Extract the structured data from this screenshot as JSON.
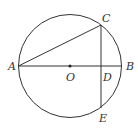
{
  "diagram": {
    "circle": {
      "cx": 70,
      "cy": 66,
      "r": 51.5,
      "stroke": "#333333"
    },
    "points": {
      "A": {
        "label": "A",
        "x": 18.5,
        "y": 66
      },
      "B": {
        "label": "B",
        "x": 121.5,
        "y": 66
      },
      "O": {
        "label": "O",
        "x": 70,
        "y": 66
      },
      "C": {
        "label": "C",
        "x": 101,
        "y": 25
      },
      "D": {
        "label": "D",
        "x": 101,
        "y": 66
      },
      "E": {
        "label": "E",
        "x": 101,
        "y": 108
      }
    },
    "segments": [
      {
        "from": "A",
        "to": "B",
        "name": "diameter-AB"
      },
      {
        "from": "A",
        "to": "C",
        "name": "chord-AC"
      },
      {
        "from": "C",
        "to": "E",
        "name": "chord-CE"
      }
    ],
    "labels": {
      "A": "A",
      "B": "B",
      "O": "O",
      "C": "C",
      "D": "D",
      "E": "E"
    }
  }
}
